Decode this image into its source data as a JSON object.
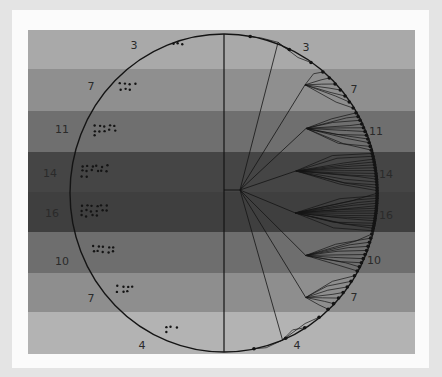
{
  "diagram": {
    "title": "",
    "bands": [
      {
        "label": "3",
        "count": 3,
        "top": 30,
        "bottom": 69,
        "color": "#a9a9a9"
      },
      {
        "label": "7",
        "count": 7,
        "top": 69,
        "bottom": 111,
        "color": "#8f8f8f"
      },
      {
        "label": "11",
        "count": 11,
        "top": 111,
        "bottom": 152,
        "color": "#6f6f6f"
      },
      {
        "label": "14",
        "count": 14,
        "top": 152,
        "bottom": 192,
        "color": "#454545"
      },
      {
        "label": "16",
        "count": 16,
        "top": 192,
        "bottom": 232,
        "color": "#3f3f3f"
      },
      {
        "label": "10",
        "count": 10,
        "top": 232,
        "bottom": 273,
        "color": "#6e6e6e"
      },
      {
        "label": "7",
        "count": 7,
        "top": 273,
        "bottom": 312,
        "color": "#8e8e8e"
      },
      {
        "label": "4",
        "count": 4,
        "top": 312,
        "bottom": 354,
        "color": "#b3b3b3"
      }
    ],
    "left_labels": [
      {
        "text": "3",
        "x": 134,
        "y": 49
      },
      {
        "text": "7",
        "x": 91,
        "y": 90
      },
      {
        "text": "11",
        "x": 62,
        "y": 133
      },
      {
        "text": "14",
        "x": 50,
        "y": 177
      },
      {
        "text": "16",
        "x": 52,
        "y": 217
      },
      {
        "text": "10",
        "x": 62,
        "y": 265
      },
      {
        "text": "7",
        "x": 91,
        "y": 302
      },
      {
        "text": "4",
        "x": 142,
        "y": 349
      }
    ],
    "right_labels": [
      {
        "text": "3",
        "x": 306,
        "y": 51
      },
      {
        "text": "7",
        "x": 354,
        "y": 93
      },
      {
        "text": "11",
        "x": 376,
        "y": 135
      },
      {
        "text": "14",
        "x": 386,
        "y": 178
      },
      {
        "text": "16",
        "x": 386,
        "y": 219
      },
      {
        "text": "10",
        "x": 374,
        "y": 264
      },
      {
        "text": "7",
        "x": 354,
        "y": 301
      },
      {
        "text": "4",
        "x": 297,
        "y": 349
      }
    ],
    "circle": {
      "cx": 224,
      "cy": 193,
      "rx": 154,
      "ry": 159
    },
    "divider_x": 224,
    "root": {
      "x": 224,
      "y": 190,
      "branch_x": 240
    },
    "colors": {
      "line": "#141414",
      "dot": "#141414",
      "background": "#e4e4e4",
      "frame": "#fbfbfb"
    }
  }
}
